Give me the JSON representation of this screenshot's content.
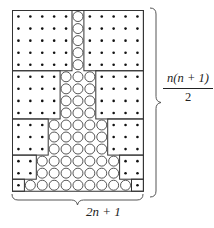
{
  "figure": {
    "n": 5,
    "columns": 11,
    "rows": 15,
    "blocks": [
      {
        "rows": 5,
        "dots_each_side": 5,
        "circles": 1
      },
      {
        "rows": 4,
        "dots_each_side": 4,
        "circles": 3
      },
      {
        "rows": 3,
        "dots_each_side": 3,
        "circles": 5
      },
      {
        "rows": 2,
        "dots_each_side": 2,
        "circles": 7
      },
      {
        "rows": 1,
        "dots_each_side": 1,
        "circles": 9
      }
    ],
    "right_label": {
      "numerator": "n(n + 1)",
      "denominator": "2"
    },
    "bottom_label": "2n + 1",
    "colors": {
      "line": "#333333",
      "dot": "#111111",
      "circle": "#444444"
    }
  }
}
